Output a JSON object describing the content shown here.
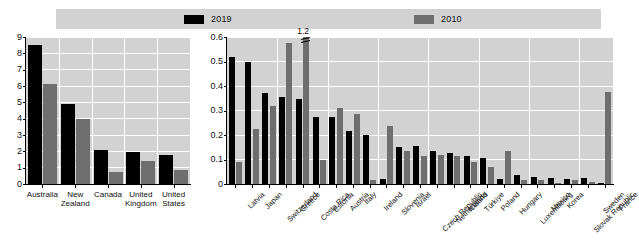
{
  "legend": {
    "items": [
      {
        "label": "2019",
        "color": "#000000",
        "name": "legend-2019"
      },
      {
        "label": "2010",
        "color": "#6e6e6e",
        "name": "legend-2010"
      }
    ]
  },
  "chart_data": [
    {
      "type": "bar",
      "id": "left-panel",
      "title": "",
      "xlabel": "",
      "ylabel": "",
      "ylim": [
        0,
        9
      ],
      "yticks": [
        0,
        1,
        2,
        3,
        4,
        5,
        6,
        7,
        8,
        9
      ],
      "grid": true,
      "legend_position": "top",
      "categories": [
        "Australia",
        "New Zealand",
        "Canada",
        "United Kingdom",
        "United States"
      ],
      "series": [
        {
          "name": "2019",
          "color": "#000000",
          "values": [
            8.5,
            4.9,
            2.1,
            1.95,
            1.75
          ]
        },
        {
          "name": "2010",
          "color": "#6e6e6e",
          "values": [
            6.1,
            4.0,
            0.75,
            1.4,
            0.85
          ]
        }
      ]
    },
    {
      "type": "bar",
      "id": "right-panel",
      "title": "",
      "xlabel": "",
      "ylabel": "",
      "ylim": [
        0,
        0.6
      ],
      "yticks": [
        0,
        0.1,
        0.2,
        0.3,
        0.4,
        0.5,
        0.6
      ],
      "ytick_labels": [
        "0",
        "0.1",
        "0.2",
        "0.3",
        "0.4",
        "0.5",
        "0.6"
      ],
      "grid": true,
      "legend_position": "top",
      "annotations": [
        {
          "text": "1.2",
          "series": "2010",
          "category": "Costa Rica",
          "note": "bar clipped at axis maximum"
        }
      ],
      "categories": [
        "Latvia",
        "Japan",
        "Switzerland",
        "Greece",
        "Costa Rica",
        "Estonia",
        "Austria",
        "Italy",
        "Ireland",
        "Slovenia",
        "Israel",
        "Czech Republic",
        "Netherlands",
        "Iceland",
        "Türkiye",
        "Poland",
        "Hungary",
        "Luxembourg",
        "Mexico",
        "Korea",
        "Slovak Republic",
        "Sweden",
        "France"
      ],
      "series": [
        {
          "name": "2019",
          "color": "#000000",
          "values": [
            0.52,
            0.5,
            0.37,
            0.355,
            0.345,
            0.275,
            0.275,
            0.215,
            0.2,
            0.02,
            0.15,
            0.155,
            0.135,
            0.125,
            0.115,
            0.105,
            0.02,
            0.035,
            0.03,
            0.025,
            0.02,
            0.025,
            0.005
          ]
        },
        {
          "name": "2010",
          "color": "#6e6e6e",
          "values": [
            0.09,
            0.225,
            0.32,
            0.575,
            0.6,
            0.1,
            0.31,
            0.285,
            0.015,
            0.235,
            0.135,
            0.115,
            0.12,
            0.115,
            0.09,
            0.07,
            0.135,
            0.015,
            0.015,
            0.005,
            0.015,
            0.01,
            0.375
          ]
        }
      ]
    }
  ]
}
